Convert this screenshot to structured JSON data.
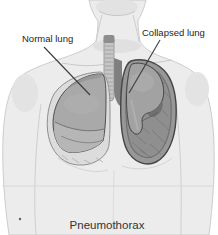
{
  "illustration": {
    "type": "medical-anatomy-illustration",
    "subject": "Human torso with open chest view showing one normal lung and one collapsed lung",
    "labels": {
      "normal_lung": "Normal lung",
      "collapsed_lung": "Collapsed lung"
    },
    "caption": "Pneumothorax"
  },
  "colors": {
    "background": "#ffffff",
    "skin": "#ececec",
    "skin_shadow": "#dedede",
    "outline": "#c2c2c2",
    "lung": "#a9a9a9",
    "lung_light": "#b6b6b6",
    "pleural_space": "#979797",
    "pleural_rim": "#454545",
    "dark_line": "#3c3c3c",
    "text": "#1e1e1e"
  }
}
